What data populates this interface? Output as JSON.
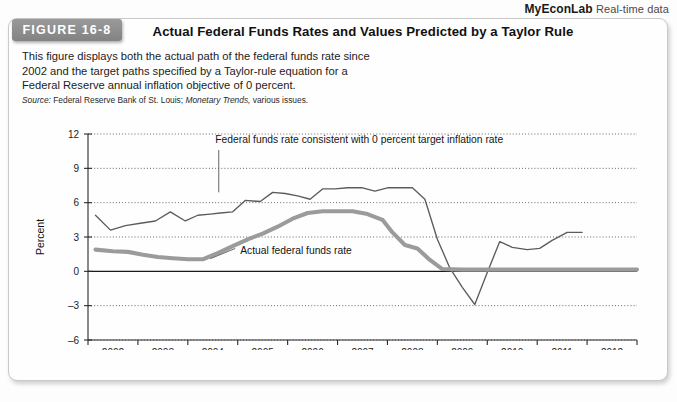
{
  "header": {
    "brand": "MyEconLab",
    "brand_suffix": "Real-time data"
  },
  "figure": {
    "badge": "FIGURE 16-8",
    "title": "Actual Federal Funds Rates and Values Predicted by a Taylor Rule",
    "description_lines": [
      "This figure displays both the actual path of the federal funds rate since",
      "2002 and the target paths specified by a Taylor-rule equation for a",
      "Federal Reserve annual inflation objective of 0 percent."
    ],
    "source_label": "Source:",
    "source_text_a": "Federal Reserve Bank of St. Louis;",
    "source_text_italic": "Monetary Trends,",
    "source_text_b": "various issues."
  },
  "chart_data": {
    "type": "line",
    "title": "Actual Federal Funds Rates and Values Predicted by a Taylor Rule",
    "xlabel": "Year",
    "ylabel": "Percent",
    "xlim": [
      2002,
      2013
    ],
    "ylim": [
      -6,
      12
    ],
    "yticks": [
      12,
      9,
      6,
      3,
      0,
      -3,
      -6
    ],
    "xticks": [
      2002,
      2003,
      2004,
      2005,
      2006,
      2007,
      2008,
      2009,
      2010,
      2011,
      2012,
      2013
    ],
    "xtick_labels": [
      "2002",
      "2003",
      "2004",
      "2005",
      "2006",
      "2007",
      "2008",
      "2009",
      "2010",
      "2011",
      "2012",
      "2013"
    ],
    "grid": "horizontal-dotted",
    "legend_position": "inline-annotations",
    "annotations": [
      {
        "text": "Federal funds rate consistent with 0 percent target inflation rate",
        "series": "taylor_rule_0_percent",
        "leader_line": true
      },
      {
        "text": "Actual federal funds rate",
        "series": "actual_federal_funds_rate",
        "leader_line": true
      }
    ],
    "series": [
      {
        "name": "Federal funds rate consistent with 0 percent target inflation rate",
        "style": "thin",
        "color": "#5c5c5c",
        "x": [
          2002.15,
          2002.45,
          2002.75,
          2003.05,
          2003.35,
          2003.65,
          2003.95,
          2004.2,
          2004.45,
          2004.65,
          2004.9,
          2005.15,
          2005.45,
          2005.7,
          2005.95,
          2006.2,
          2006.45,
          2006.7,
          2006.95,
          2007.2,
          2007.5,
          2007.75,
          2008.0,
          2008.25,
          2008.5,
          2008.75,
          2009.0,
          2009.25,
          2009.5,
          2009.75,
          2010.0,
          2010.25,
          2010.5,
          2010.8,
          2011.05,
          2011.3,
          2011.6,
          2011.9
        ],
        "y": [
          4.9,
          3.6,
          4.0,
          4.2,
          4.4,
          5.2,
          4.4,
          4.9,
          5.0,
          5.1,
          5.2,
          6.2,
          6.1,
          6.9,
          6.8,
          6.6,
          6.3,
          7.2,
          7.2,
          7.3,
          7.3,
          7.0,
          7.3,
          7.3,
          7.3,
          6.3,
          2.8,
          0.3,
          -1.4,
          -2.9,
          -0.1,
          2.6,
          2.1,
          1.9,
          2.0,
          2.7,
          3.4,
          3.4
        ]
      },
      {
        "name": "Actual federal funds rate",
        "style": "thick",
        "color": "#9b9b9b",
        "x": [
          2002.15,
          2002.5,
          2002.8,
          2003.1,
          2003.4,
          2003.7,
          2004.0,
          2004.3,
          2004.6,
          2004.9,
          2005.2,
          2005.5,
          2005.8,
          2006.1,
          2006.4,
          2006.7,
          2007.0,
          2007.3,
          2007.6,
          2007.9,
          2008.1,
          2008.35,
          2008.6,
          2008.85,
          2009.1,
          2009.5,
          2010.0,
          2010.5,
          2011.0,
          2011.5,
          2012.0,
          2012.5,
          2013.0
        ],
        "y": [
          1.9,
          1.75,
          1.7,
          1.45,
          1.25,
          1.15,
          1.05,
          1.05,
          1.6,
          2.2,
          2.8,
          3.3,
          3.9,
          4.6,
          5.1,
          5.25,
          5.25,
          5.25,
          5.0,
          4.5,
          3.4,
          2.3,
          2.0,
          1.0,
          0.2,
          0.15,
          0.15,
          0.15,
          0.15,
          0.15,
          0.15,
          0.15,
          0.15
        ]
      }
    ]
  }
}
